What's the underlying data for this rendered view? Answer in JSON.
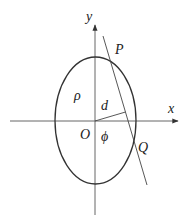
{
  "diagram": {
    "colors": {
      "stroke": "#333333",
      "axis": "#555555",
      "text": "#222222"
    },
    "labels": {
      "y_axis": "y",
      "x_axis": "x",
      "point_p": "P",
      "point_q": "Q",
      "origin": "O",
      "density": "ρ",
      "distance": "d",
      "angle": "ϕ"
    }
  }
}
